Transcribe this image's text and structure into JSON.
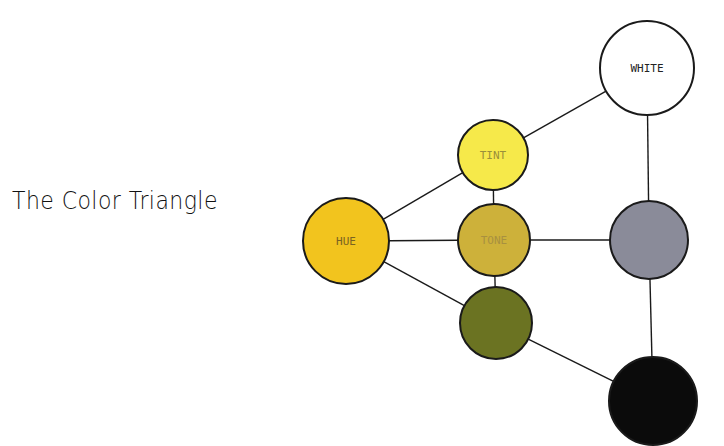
{
  "title": "The Color Triangle",
  "nodes": [
    {
      "id": "white",
      "label": "WHITE",
      "cx": 647,
      "cy": 68,
      "r": 47,
      "fill": "#ffffff",
      "label_color": "#222222"
    },
    {
      "id": "tint",
      "label": "TINT",
      "cx": 493,
      "cy": 155,
      "r": 35,
      "fill": "#f6e94a",
      "label_color": "#9a8f3a"
    },
    {
      "id": "hue",
      "label": "HUE",
      "cx": 346,
      "cy": 241,
      "r": 43,
      "fill": "#f2c41e",
      "label_color": "#7a6322"
    },
    {
      "id": "tone",
      "label": "TONE",
      "cx": 494,
      "cy": 240,
      "r": 36,
      "fill": "#cdb13a",
      "label_color": "#a89040"
    },
    {
      "id": "gray",
      "label": "",
      "cx": 649,
      "cy": 240,
      "r": 39,
      "fill": "#8a8b99",
      "label_color": "#333333"
    },
    {
      "id": "shade",
      "label": "",
      "cx": 496,
      "cy": 323,
      "r": 36,
      "fill": "#6b7322",
      "label_color": "#333333"
    },
    {
      "id": "black",
      "label": "",
      "cx": 653,
      "cy": 401,
      "r": 44,
      "fill": "#0b0b0b",
      "label_color": "#ffffff"
    }
  ],
  "edges": [
    [
      "hue",
      "tint"
    ],
    [
      "hue",
      "tone"
    ],
    [
      "hue",
      "shade"
    ],
    [
      "tint",
      "white"
    ],
    [
      "tint",
      "tone"
    ],
    [
      "tone",
      "shade"
    ],
    [
      "tone",
      "gray"
    ],
    [
      "white",
      "gray"
    ],
    [
      "gray",
      "black"
    ],
    [
      "shade",
      "black"
    ]
  ],
  "colors": {
    "stroke": "#1a1a1a",
    "background": "#ffffff"
  }
}
